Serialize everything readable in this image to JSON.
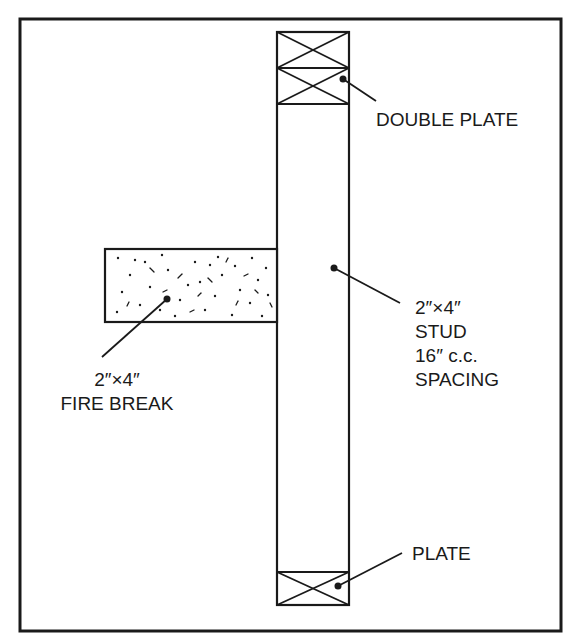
{
  "diagram": {
    "type": "wall framing detail",
    "colors": {
      "line": "#1a1a1a",
      "background": "#ffffff"
    },
    "components": {
      "double_plate": {
        "label": "DOUBLE PLATE"
      },
      "stud": {
        "label_lines": [
          "2″×4″",
          "STUD",
          "16″ c.c.",
          "SPACING"
        ]
      },
      "fire_break": {
        "label_lines": [
          "2″×4″",
          "FIRE BREAK"
        ]
      },
      "plate": {
        "label": "PLATE"
      }
    }
  }
}
